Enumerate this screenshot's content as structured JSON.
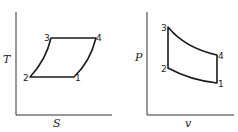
{
  "diagrams": [
    {
      "id": "ts",
      "y_label": "T",
      "x_label": "S",
      "points": [
        {
          "label": "1"
        },
        {
          "label": "2"
        },
        {
          "label": "3"
        },
        {
          "label": "4"
        }
      ]
    },
    {
      "id": "pv",
      "y_label": "P",
      "x_label": "v",
      "points": [
        {
          "label": "1"
        },
        {
          "label": "2"
        },
        {
          "label": "3"
        },
        {
          "label": "4"
        }
      ]
    }
  ]
}
